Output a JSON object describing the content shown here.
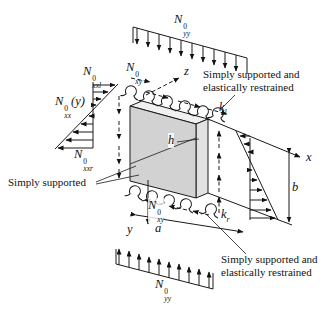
{
  "colors": {
    "background": "#ffffff",
    "line": "#1a1a1a",
    "plate_front": "#d2d2d2",
    "plate_top": "#f0f0f0",
    "plate_side": "#e2e2e2"
  },
  "labels": {
    "n_yy_top": {
      "base": "N",
      "sup": "0",
      "sub": "yy"
    },
    "n_xy_top": {
      "base": "N",
      "sup": "0",
      "sub": "xy"
    },
    "n_xxl": {
      "base": "N",
      "sup": "0",
      "sub": "xxl"
    },
    "n_xx_y": {
      "base": "N",
      "sup": "0",
      "sub": "xx",
      "suffix": "(y)"
    },
    "n_xxr": {
      "base": "N",
      "sup": "0",
      "sub": "xxr"
    },
    "n_xy_bottom": {
      "base": "N",
      "sup": "0",
      "sub": "xy"
    },
    "n_yy_bottom": {
      "base": "N",
      "sup": "0",
      "sub": "yy"
    },
    "k_top": {
      "base": "k",
      "sub": "l"
    },
    "k_bottom": {
      "base": "k",
      "sub": "r"
    },
    "axis_x": "x",
    "axis_y": "y",
    "axis_z": "z",
    "dim_a": "a",
    "dim_b": "b",
    "thickness_h": "h"
  },
  "annotations": {
    "support_left": "Simply supported",
    "support_top": {
      "line1": "Simply supported and",
      "line2": "elastically restrained"
    },
    "support_bottom": {
      "line1": "Simply supported and",
      "line2": "elastically restrained"
    }
  }
}
